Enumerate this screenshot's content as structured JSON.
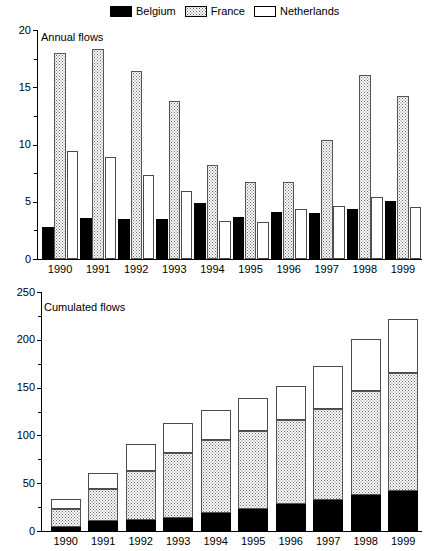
{
  "legend": {
    "entries": [
      {
        "label": "Belgium",
        "color": "#000000",
        "pattern": "solid-black"
      },
      {
        "label": "France",
        "color": "#c8c8c8",
        "pattern": "dotted-grey"
      },
      {
        "label": "Netherlands",
        "color": "#ffffff",
        "pattern": "open-white"
      }
    ]
  },
  "chart_data": [
    {
      "type": "bar",
      "title": "Annual flows",
      "xlabel": "",
      "ylabel": "",
      "ylim": [
        0,
        20
      ],
      "yticks": [
        0,
        5,
        10,
        15,
        20
      ],
      "yticklabels": [
        "0",
        "5",
        "10",
        "15",
        "20"
      ],
      "yminorticks": [
        2.5,
        7.5,
        12.5,
        17.5
      ],
      "grid": false,
      "legend_position": "top",
      "grouping": "grouped",
      "categories": [
        "1990",
        "1991",
        "1992",
        "1993",
        "1994",
        "1995",
        "1996",
        "1997",
        "1998",
        "1999"
      ],
      "series": [
        {
          "name": "Belgium",
          "values": [
            2.8,
            3.6,
            3.5,
            3.5,
            4.9,
            3.7,
            4.1,
            4.0,
            4.4,
            5.1
          ]
        },
        {
          "name": "France",
          "values": [
            18.0,
            18.3,
            16.4,
            13.8,
            8.2,
            6.7,
            6.7,
            10.4,
            16.1,
            14.2
          ]
        },
        {
          "name": "Netherlands",
          "values": [
            9.4,
            8.9,
            7.3,
            5.9,
            3.3,
            3.2,
            4.4,
            4.6,
            5.4,
            4.5
          ]
        }
      ]
    },
    {
      "type": "bar",
      "title": "Cumulated flows",
      "xlabel": "",
      "ylabel": "",
      "ylim": [
        0,
        250
      ],
      "yticks": [
        0,
        50,
        100,
        150,
        200,
        250
      ],
      "yticklabels": [
        "0",
        "50",
        "100",
        "150",
        "200",
        "250"
      ],
      "yminorticks": [
        25,
        75,
        125,
        175,
        225
      ],
      "grid": false,
      "legend_position": "top",
      "grouping": "stacked",
      "categories": [
        "1990",
        "1991",
        "1992",
        "1993",
        "1994",
        "1995",
        "1996",
        "1997",
        "1998",
        "1999"
      ],
      "series": [
        {
          "name": "Belgium",
          "values": [
            4,
            10,
            11,
            14,
            19,
            23,
            28,
            32,
            38,
            42
          ]
        },
        {
          "name": "France",
          "values": [
            19,
            34,
            52,
            68,
            76,
            82,
            88,
            96,
            108,
            123
          ]
        },
        {
          "name": "Netherlands",
          "values": [
            10,
            17,
            28,
            31,
            32,
            34,
            36,
            45,
            55,
            57
          ]
        }
      ],
      "cumulative_tops": {
        "belgium": [
          4,
          10,
          11,
          14,
          19,
          23,
          28,
          32,
          38,
          42
        ],
        "france": [
          23,
          44,
          63,
          82,
          95,
          105,
          116,
          128,
          146,
          165
        ],
        "netherlands": [
          33,
          61,
          91,
          113,
          127,
          139,
          152,
          173,
          201,
          222
        ]
      }
    }
  ]
}
